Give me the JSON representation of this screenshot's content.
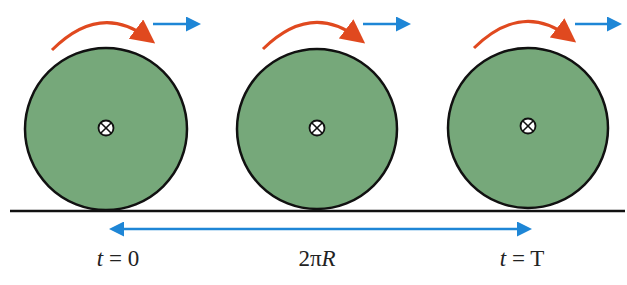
{
  "colors": {
    "wheel_fill": "#76a87a",
    "wheel_stroke": "#111111",
    "rotation_arrow": "#e0491f",
    "velocity_arrow": "#1e86d6",
    "ground": "#111111"
  },
  "wheels": [
    {
      "cx": 106,
      "cy": 129,
      "r": 81,
      "center_symbol": "into-page-x-icon",
      "time_label": "t = 0"
    },
    {
      "cx": 317,
      "cy": 129,
      "r": 80,
      "center_symbol": "into-page-x-icon"
    },
    {
      "cx": 528,
      "cy": 128,
      "r": 80,
      "center_symbol": "into-page-x-icon",
      "time_label": "t = T"
    }
  ],
  "labels": {
    "start": {
      "var": "t",
      "rest": " = 0"
    },
    "distance": {
      "prefix": "2π",
      "var": "R"
    },
    "end": {
      "var": "t",
      "rest": " = T"
    }
  },
  "distance_arrow": {
    "x1": 108,
    "x2": 533,
    "y": 229
  }
}
